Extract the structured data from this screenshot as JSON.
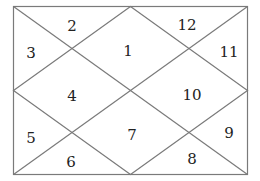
{
  "chart": {
    "type": "north-indian-kundli",
    "line_color": "#7a7a7a",
    "houses": [
      {
        "label": "1",
        "x": 128,
        "y": 52
      },
      {
        "label": "2",
        "x": 72,
        "y": 27
      },
      {
        "label": "3",
        "x": 31,
        "y": 54
      },
      {
        "label": "4",
        "x": 72,
        "y": 97
      },
      {
        "label": "5",
        "x": 31,
        "y": 139
      },
      {
        "label": "6",
        "x": 71,
        "y": 163
      },
      {
        "label": "7",
        "x": 132,
        "y": 136
      },
      {
        "label": "8",
        "x": 192,
        "y": 160
      },
      {
        "label": "9",
        "x": 229,
        "y": 134
      },
      {
        "label": "10",
        "x": 192,
        "y": 96
      },
      {
        "label": "11",
        "x": 229,
        "y": 53
      },
      {
        "label": "12",
        "x": 187,
        "y": 26
      }
    ]
  }
}
